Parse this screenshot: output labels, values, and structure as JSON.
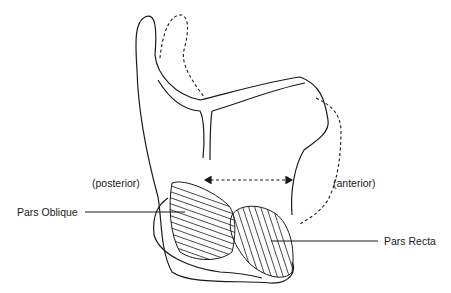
{
  "diagram": {
    "type": "anatomical line drawing",
    "labels": {
      "posterior": "(posterior)",
      "anterior": "(anterior)",
      "pars_oblique": "Pars Oblique",
      "pars_recta": "Pars Recta"
    },
    "colors": {
      "stroke": "#1a1a1a",
      "background": "#ffffff"
    },
    "arrow": {
      "style": "dashed",
      "direction": "bidirectional"
    }
  }
}
